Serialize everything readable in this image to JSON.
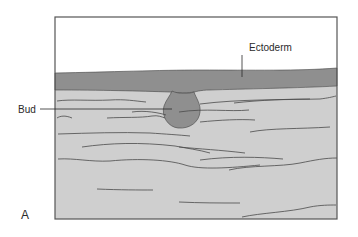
{
  "figure": {
    "panel_label": "A",
    "labels": {
      "ectoderm": "Ectoderm",
      "bud": "Bud"
    },
    "colors": {
      "background": "#ffffff",
      "frame": "#555555",
      "ectoderm": "#8f8f8f",
      "mesenchyme": "#cfcfcf",
      "bud": "#8f8f8f",
      "fibers": "#4a4a4a"
    }
  }
}
